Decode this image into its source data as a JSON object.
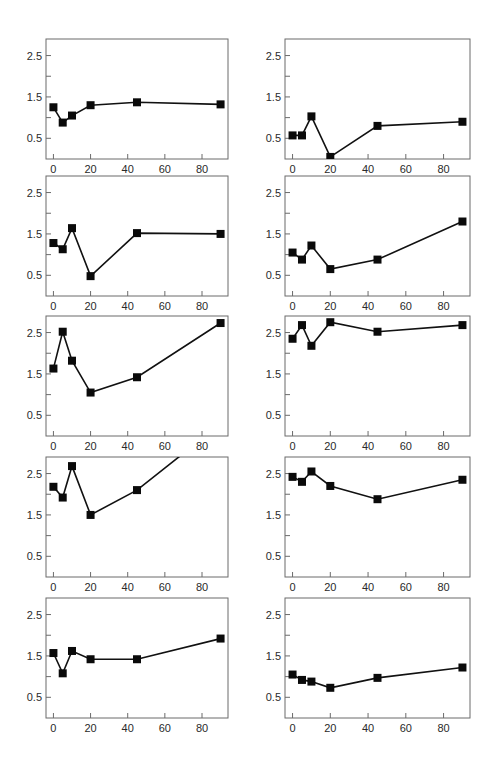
{
  "figure": {
    "layout": {
      "rows": 5,
      "cols": 2
    },
    "style": {
      "frame_color": "#6b6b6b",
      "line_color": "#111111",
      "marker_color": "#0a0a0a",
      "tick_label_color": "#2a2a2a"
    }
  },
  "chart_data": [
    {
      "panel": "row1-left",
      "type": "line",
      "title": "",
      "xlabel": "",
      "ylabel": "",
      "x": [
        0,
        5,
        10,
        20,
        45,
        90
      ],
      "values": [
        1.25,
        0.88,
        1.05,
        1.3,
        1.37,
        1.32
      ],
      "xlim": [
        -4,
        94
      ],
      "ylim": [
        0,
        2.9
      ],
      "xticks": [
        0,
        20,
        40,
        60,
        80
      ],
      "yticks": [
        0.5,
        1.0,
        1.5,
        2.0,
        2.5
      ],
      "ytick_labels": [
        "0.5",
        "",
        "1.5",
        "",
        "2.5"
      ],
      "marker": "square",
      "grid": false,
      "legend": null
    },
    {
      "panel": "row1-right",
      "type": "line",
      "title": "",
      "xlabel": "",
      "ylabel": "",
      "x": [
        0,
        5,
        10,
        20,
        45,
        90
      ],
      "values": [
        0.57,
        0.57,
        1.03,
        0.05,
        0.8,
        0.9
      ],
      "xlim": [
        -4,
        94
      ],
      "ylim": [
        0,
        2.9
      ],
      "xticks": [
        0,
        20,
        40,
        60,
        80
      ],
      "yticks": [
        0.5,
        1.0,
        1.5,
        2.0,
        2.5
      ],
      "ytick_labels": [
        "0.5",
        "",
        "1.5",
        "",
        "2.5"
      ],
      "marker": "square",
      "grid": false,
      "legend": null
    },
    {
      "panel": "row2-left",
      "type": "line",
      "title": "",
      "xlabel": "",
      "ylabel": "",
      "x": [
        0,
        5,
        10,
        20,
        45,
        90
      ],
      "values": [
        1.28,
        1.13,
        1.64,
        0.48,
        1.52,
        1.5
      ],
      "xlim": [
        -4,
        94
      ],
      "ylim": [
        0,
        2.9
      ],
      "xticks": [
        0,
        20,
        40,
        60,
        80
      ],
      "yticks": [
        0.5,
        1.0,
        1.5,
        2.0,
        2.5
      ],
      "ytick_labels": [
        "0.5",
        "",
        "1.5",
        "",
        "2.5"
      ],
      "marker": "square",
      "grid": false,
      "legend": null
    },
    {
      "panel": "row2-right",
      "type": "line",
      "title": "",
      "xlabel": "",
      "ylabel": "",
      "x": [
        0,
        5,
        10,
        20,
        45,
        90
      ],
      "values": [
        1.05,
        0.88,
        1.22,
        0.65,
        0.88,
        1.8
      ],
      "xlim": [
        -4,
        94
      ],
      "ylim": [
        0,
        2.9
      ],
      "xticks": [
        0,
        20,
        40,
        60,
        80
      ],
      "yticks": [
        0.5,
        1.0,
        1.5,
        2.0,
        2.5
      ],
      "ytick_labels": [
        "0.5",
        "",
        "1.5",
        "",
        "2.5"
      ],
      "marker": "square",
      "grid": false,
      "legend": null
    },
    {
      "panel": "row3-left",
      "type": "line",
      "title": "",
      "xlabel": "",
      "ylabel": "",
      "x": [
        0,
        5,
        10,
        20,
        45,
        90
      ],
      "values": [
        1.63,
        2.52,
        1.82,
        1.05,
        1.42,
        2.73
      ],
      "xlim": [
        -4,
        94
      ],
      "ylim": [
        0,
        2.9
      ],
      "xticks": [
        0,
        20,
        40,
        60,
        80
      ],
      "yticks": [
        0.5,
        1.0,
        1.5,
        2.0,
        2.5
      ],
      "ytick_labels": [
        "0.5",
        "",
        "1.5",
        "",
        "2.5"
      ],
      "marker": "square",
      "grid": false,
      "legend": null
    },
    {
      "panel": "row3-right",
      "type": "line",
      "title": "",
      "xlabel": "",
      "ylabel": "",
      "x": [
        0,
        5,
        10,
        20,
        45,
        90
      ],
      "values": [
        2.35,
        2.68,
        2.18,
        2.75,
        2.52,
        2.68
      ],
      "xlim": [
        -4,
        94
      ],
      "ylim": [
        0,
        2.9
      ],
      "xticks": [
        0,
        20,
        40,
        60,
        80
      ],
      "yticks": [
        0.5,
        1.0,
        1.5,
        2.0,
        2.5
      ],
      "ytick_labels": [
        "0.5",
        "",
        "1.5",
        "",
        "2.5"
      ],
      "marker": "square",
      "grid": false,
      "legend": null
    },
    {
      "panel": "row4-left",
      "type": "line",
      "title": "",
      "xlabel": "",
      "ylabel": "",
      "x": [
        0,
        5,
        10,
        20,
        45,
        90
      ],
      "values": [
        2.18,
        1.92,
        2.68,
        1.5,
        2.1,
        3.7
      ],
      "note": "last point off-scale (line clipped at top of plot)",
      "xlim": [
        -4,
        94
      ],
      "ylim": [
        0,
        2.9
      ],
      "xticks": [
        0,
        20,
        40,
        60,
        80
      ],
      "yticks": [
        0.5,
        1.0,
        1.5,
        2.0,
        2.5
      ],
      "ytick_labels": [
        "0.5",
        "",
        "1.5",
        "",
        "2.5"
      ],
      "marker": "square",
      "grid": false,
      "legend": null
    },
    {
      "panel": "row4-right",
      "type": "line",
      "title": "",
      "xlabel": "",
      "ylabel": "",
      "x": [
        0,
        5,
        10,
        20,
        45,
        90
      ],
      "values": [
        2.42,
        2.3,
        2.55,
        2.2,
        1.88,
        2.35
      ],
      "xlim": [
        -4,
        94
      ],
      "ylim": [
        0,
        2.9
      ],
      "xticks": [
        0,
        20,
        40,
        60,
        80
      ],
      "yticks": [
        0.5,
        1.0,
        1.5,
        2.0,
        2.5
      ],
      "ytick_labels": [
        "0.5",
        "",
        "1.5",
        "",
        "2.5"
      ],
      "marker": "square",
      "grid": false,
      "legend": null
    },
    {
      "panel": "row5-left",
      "type": "line",
      "title": "",
      "xlabel": "",
      "ylabel": "",
      "x": [
        0,
        5,
        10,
        20,
        45,
        90
      ],
      "values": [
        1.57,
        1.08,
        1.62,
        1.42,
        1.42,
        1.92
      ],
      "xlim": [
        -4,
        94
      ],
      "ylim": [
        0,
        2.9
      ],
      "xticks": [
        0,
        20,
        40,
        60,
        80
      ],
      "yticks": [
        0.5,
        1.0,
        1.5,
        2.0,
        2.5
      ],
      "ytick_labels": [
        "0.5",
        "",
        "1.5",
        "",
        "2.5"
      ],
      "marker": "square",
      "grid": false,
      "legend": null
    },
    {
      "panel": "row5-right",
      "type": "line",
      "title": "",
      "xlabel": "",
      "ylabel": "",
      "x": [
        0,
        5,
        10,
        20,
        45,
        90
      ],
      "values": [
        1.05,
        0.92,
        0.88,
        0.73,
        0.97,
        1.22
      ],
      "xlim": [
        -4,
        94
      ],
      "ylim": [
        0,
        2.9
      ],
      "xticks": [
        0,
        20,
        40,
        60,
        80
      ],
      "yticks": [
        0.5,
        1.0,
        1.5,
        2.0,
        2.5
      ],
      "ytick_labels": [
        "0.5",
        "",
        "1.5",
        "",
        "2.5"
      ],
      "marker": "square",
      "grid": false,
      "legend": null
    }
  ]
}
